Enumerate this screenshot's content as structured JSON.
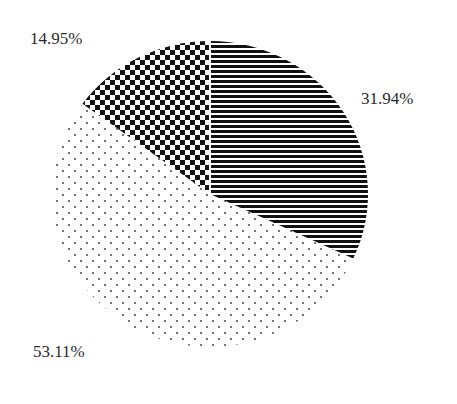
{
  "chart_data": {
    "type": "pie",
    "title": "",
    "categories": [
      "Slice A (horizontal stripes)",
      "Slice B (dots)",
      "Slice C (checkerboard)"
    ],
    "values": [
      31.94,
      53.11,
      14.95
    ],
    "labels": [
      "31.94%",
      "53.11%",
      "14.95%"
    ],
    "patterns": [
      "horizontal-stripes",
      "dots",
      "checkerboard"
    ],
    "start_angle": "12 o'clock",
    "direction": "clockwise",
    "legend": "none",
    "colors": {
      "ink": "#111111",
      "background": "#ffffff",
      "label": "#2a2a2a"
    }
  },
  "labels": {
    "slice_a": "31.94%",
    "slice_b": "53.11%",
    "slice_c": "14.95%"
  }
}
